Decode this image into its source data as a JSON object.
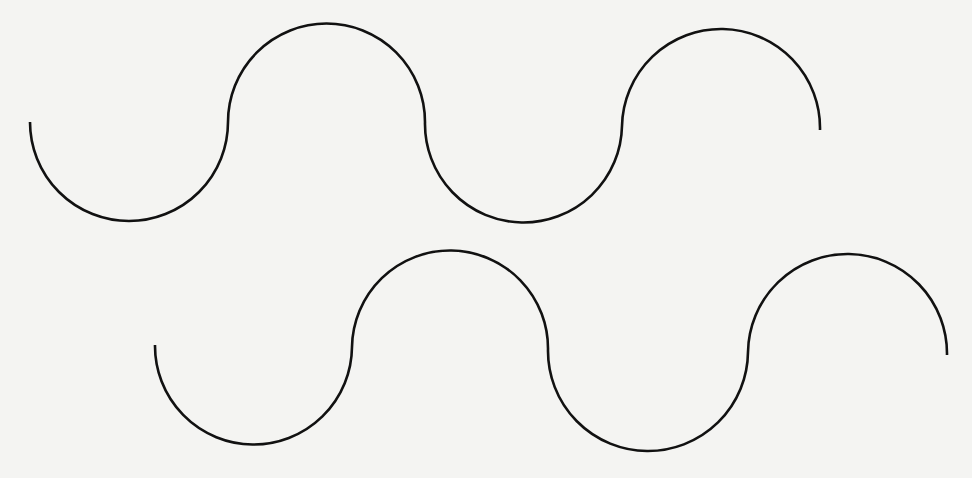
{
  "diagram": {
    "background": "#f4f4f2",
    "stroke_color": "#111111",
    "waves": [
      {
        "name": "top-wave",
        "path": "M 30 122 A 98 98 0 0 0 228 122 A 98 98 0 0 1 425 122 A 98 98 0 0 0 622 126 A 98 98 0 0 1 820 130"
      },
      {
        "name": "bottom-wave",
        "path": "M 155 345 A 98 98 0 0 0 352 347 A 98 98 0 0 1 548 350 A 98 98 0 0 0 748 352 A 98 98 0 0 1 947 355"
      }
    ]
  }
}
